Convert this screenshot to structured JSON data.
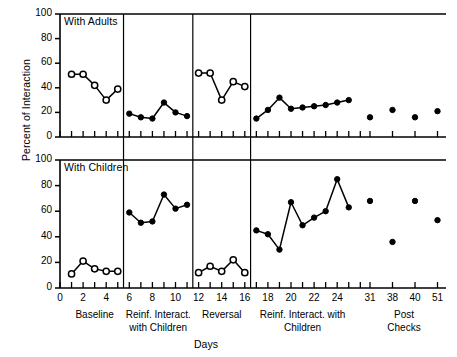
{
  "axes": {
    "ylabel": "Percent of Interaction",
    "xlabel": "Days",
    "yticks": [
      "0",
      "20",
      "40",
      "60",
      "80",
      "100"
    ],
    "xticks_labeled": [
      "0",
      "2",
      "4",
      "6",
      "8",
      "10",
      "12",
      "14",
      "16",
      "18",
      "20",
      "22",
      "24",
      "31",
      "38",
      "40",
      "51"
    ]
  },
  "panels": {
    "top": {
      "title": "With Adults"
    },
    "bottom": {
      "title": "With Children"
    }
  },
  "phases": [
    {
      "name": "baseline",
      "label": "Baseline"
    },
    {
      "name": "reinforced-interaction-children-1",
      "label": "Reinf. Interact.\nwith Children"
    },
    {
      "name": "reversal",
      "label": "Reversal"
    },
    {
      "name": "reinforced-interaction-children-2",
      "label": "Reinf. Interact. with\nChildren"
    },
    {
      "name": "post-checks",
      "label": "Post\nChecks"
    }
  ],
  "chart_data": {
    "type": "line",
    "title": "",
    "xlabel": "Days",
    "ylabel": "Percent of Interaction",
    "ylim": [
      0,
      100
    ],
    "xlim": [
      0,
      26
    ],
    "grid": false,
    "legend": null,
    "panels": [
      {
        "name": "With Adults",
        "series": [
          {
            "name": "Baseline",
            "marker": "open-circle",
            "x": [
              1,
              2,
              3,
              4,
              5
            ],
            "y": [
              51,
              51,
              42,
              30,
              39
            ]
          },
          {
            "name": "Reinf. Interact. with Children",
            "marker": "filled-circle",
            "x": [
              6,
              7,
              8,
              9,
              10,
              11
            ],
            "y": [
              19,
              16,
              15,
              28,
              20,
              17
            ]
          },
          {
            "name": "Reversal",
            "marker": "open-circle",
            "x": [
              12,
              13,
              14,
              15,
              16
            ],
            "y": [
              52,
              52,
              30,
              45,
              41
            ]
          },
          {
            "name": "Reinf. Interact. with Children 2",
            "marker": "filled-circle",
            "x": [
              17,
              18,
              19,
              20,
              21,
              22,
              23,
              24,
              25
            ],
            "y": [
              15,
              22,
              32,
              23,
              24,
              25,
              26,
              28,
              30
            ]
          },
          {
            "name": "Post Checks",
            "marker": "filled-circle-nolines",
            "x": [
              31,
              38,
              40,
              51
            ],
            "y": [
              16,
              22,
              16,
              21
            ]
          }
        ]
      },
      {
        "name": "With Children",
        "series": [
          {
            "name": "Baseline",
            "marker": "open-circle",
            "x": [
              1,
              2,
              3,
              4,
              5
            ],
            "y": [
              11,
              21,
              15,
              13,
              13
            ]
          },
          {
            "name": "Reinf. Interact. with Children",
            "marker": "filled-circle",
            "x": [
              6,
              7,
              8,
              9,
              10,
              11
            ],
            "y": [
              59,
              51,
              52,
              73,
              62,
              65
            ]
          },
          {
            "name": "Reversal",
            "marker": "open-circle",
            "x": [
              12,
              13,
              14,
              15,
              16
            ],
            "y": [
              12,
              17,
              13,
              22,
              12
            ]
          },
          {
            "name": "Reinf. Interact. with Children 2",
            "marker": "filled-circle",
            "x": [
              17,
              18,
              19,
              20,
              21,
              22,
              23,
              24,
              25
            ],
            "y": [
              45,
              42,
              30,
              67,
              49,
              55,
              60,
              85,
              63
            ]
          },
          {
            "name": "Post Checks",
            "marker": "filled-circle-nolines",
            "x": [
              31,
              38,
              40,
              51
            ],
            "y": [
              68,
              36,
              68,
              53
            ]
          }
        ]
      }
    ]
  }
}
